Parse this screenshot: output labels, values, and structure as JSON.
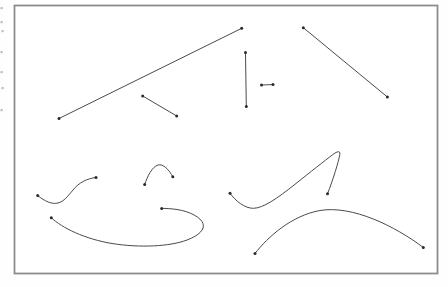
{
  "figure": {
    "canvas": {
      "width": 448,
      "height": 287,
      "background": "#fefefe"
    },
    "frame": {
      "x": 14.5,
      "y": 5.5,
      "width": 423,
      "height": 268,
      "stroke": "#8d8d8d",
      "stroke_width": 1.8,
      "fill": "#ffffff"
    },
    "style": {
      "line_color": "#4a4a4a",
      "line_width": 1,
      "dot_color": "#2b2b2b",
      "dot_radius": 1.5,
      "margin_mark_color": "#a9a9a9"
    },
    "lines": [
      {
        "id": "long-rising-diagonal",
        "x1": 59,
        "y1": 118.5,
        "x2": 241.7,
        "y2": 28.3
      },
      {
        "id": "short-falling-diagonal",
        "x1": 142.7,
        "y1": 96,
        "x2": 176.7,
        "y2": 116
      },
      {
        "id": "vertical-segment",
        "x1": 245.5,
        "y1": 52.5,
        "x2": 246.3,
        "y2": 106.5
      },
      {
        "id": "short-horizontal-segment",
        "x1": 261.5,
        "y1": 85,
        "x2": 273,
        "y2": 84.6
      },
      {
        "id": "long-falling-diagonal",
        "x1": 303.3,
        "y1": 27.7,
        "x2": 387.4,
        "y2": 97
      }
    ],
    "curves": [
      {
        "id": "s-curve",
        "path": "M 37.7,195.5 C 45,201.5 52,204.5 58,203 C 64,201.5 68,196 73,190 C 79,182.5 87,178.5 96,177.5",
        "ends": [
          [
            37.7,
            195.5
          ],
          [
            96,
            177.5
          ]
        ]
      },
      {
        "id": "small-arch",
        "path": "M 144.7,184.5 C 147.5,176 152,167 158,165 C 163,163.5 169,169.5 172.8,176.8",
        "ends": [
          [
            144.7,
            184.5
          ],
          [
            172.8,
            176.8
          ]
        ]
      },
      {
        "id": "open-loop-swoosh",
        "path": "M 51.3,217.7 C 62,228 85,239 112,243.5 C 140,248 170,246.5 187,240 C 199,235.5 205,229.5 203,223.5 C 201,217.5 190,211.5 177,209.5 C 171.5,208.7 166,208.3 161.7,208.4",
        "ends": [
          [
            51.3,
            217.7
          ],
          [
            161.7,
            208.4
          ]
        ]
      },
      {
        "id": "hooked-sweep",
        "path": "M 230,193.3 C 235.5,201 245,208.5 253.5,208.3 C 263,208 276,199.5 296,183.5 C 310,172.3 325,160.5 332.5,154.8 C 337.5,151 340.5,150.5 339.8,154.5 C 338.8,161 333,180 327.5,193.8",
        "ends": [
          [
            230,
            193.3
          ],
          [
            327.5,
            193.8
          ]
        ]
      },
      {
        "id": "broad-arch",
        "path": "M 255,253.5 C 268,236.5 292,215.5 320,210.5 C 352,205 395,226 423.3,247.5",
        "ends": [
          [
            255,
            253.5
          ],
          [
            423.3,
            247.5
          ]
        ]
      }
    ],
    "margin_marks": [
      {
        "x": 0.5,
        "y": 7
      },
      {
        "x": 0.5,
        "y": 21
      },
      {
        "x": 1.5,
        "y": 30
      },
      {
        "x": 0.5,
        "y": 51
      },
      {
        "x": 0.5,
        "y": 71
      },
      {
        "x": 1.5,
        "y": 87
      },
      {
        "x": 0.5,
        "y": 109
      }
    ]
  }
}
